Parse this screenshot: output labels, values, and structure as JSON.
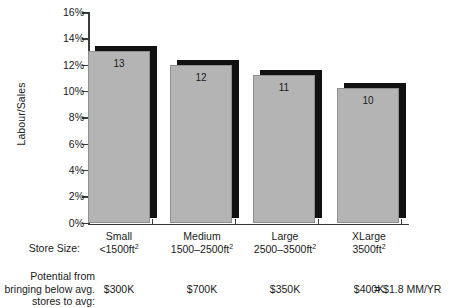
{
  "chart_data": {
    "type": "bar",
    "title": "",
    "xlabel": "Store Size:",
    "ylabel": "Labour/Sales",
    "ylim": [
      0,
      16
    ],
    "yunit": "%",
    "grid": false,
    "legend": "none",
    "categories": [
      "Small",
      "Medium",
      "Large",
      "XLarge"
    ],
    "values": [
      13.0,
      12.0,
      11.2,
      10.2
    ],
    "bar_labels": [
      "13",
      "12",
      "11",
      "10"
    ],
    "ytick_labels": [
      "16%",
      "14%",
      "12%",
      "10%",
      "8%",
      "6%",
      "4%",
      "2%",
      "0%"
    ],
    "ytick_values": [
      16,
      14,
      12,
      10,
      8,
      6,
      4,
      2,
      0
    ],
    "series": [
      {
        "name": "Labour/Sales",
        "values": [
          13.0,
          12.0,
          11.2,
          10.2
        ]
      }
    ]
  },
  "axis": {
    "y_title": "Labour/Sales"
  },
  "table": {
    "row1_label": "Store Size:",
    "row2_label_lines": [
      "Potential from",
      "bringing below",
      "avg. stores to avg:"
    ],
    "row2_label_l1": "Potential from",
    "row2_label_l2": "bringing below",
    "row2_label_l3": "avg. stores to avg:",
    "columns": [
      {
        "size_name": "Small",
        "size_range": "<1500ft",
        "size_sup": "2",
        "potential": "$300K"
      },
      {
        "size_name": "Medium",
        "size_range": "1500–2500ft",
        "size_sup": "2",
        "potential": "$700K"
      },
      {
        "size_name": "Large",
        "size_range": "2500–3500ft",
        "size_sup": "2",
        "potential": "$350K"
      },
      {
        "size_name": "XLarge",
        "size_range": "3500ft",
        "size_sup": "2",
        "potential": "$400K"
      }
    ],
    "total_note": "= $1.8 MM/YR"
  },
  "colors": {
    "bar_fill": "#b4b4b4",
    "bar_shadow": "#111111",
    "axis": "#3a3a3a",
    "text": "#1a1a1a",
    "background": "#ffffff"
  }
}
